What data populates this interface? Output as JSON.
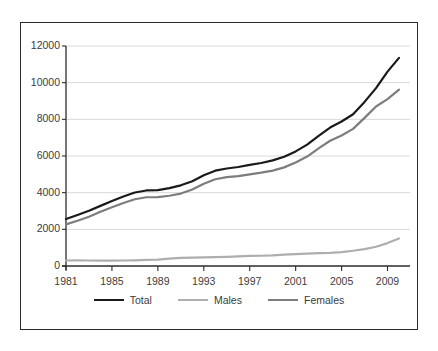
{
  "chart_data": {
    "type": "line",
    "title": "",
    "subtitle": "",
    "xlabel": "",
    "ylabel": "",
    "xlim": [
      1981,
      2010
    ],
    "ylim": [
      0,
      12000
    ],
    "grid": "horizontal",
    "legend_position": "bottom",
    "x": [
      1981,
      1982,
      1983,
      1984,
      1985,
      1986,
      1987,
      1988,
      1989,
      1990,
      1991,
      1992,
      1993,
      1994,
      1995,
      1996,
      1997,
      1998,
      1999,
      2000,
      2001,
      2002,
      2003,
      2004,
      2005,
      2006,
      2007,
      2008,
      2009,
      2010
    ],
    "xticks": [
      1981,
      1985,
      1989,
      1993,
      1997,
      2001,
      2005,
      2009
    ],
    "xtick_labels": [
      "1981",
      "1985",
      "1989",
      "1993",
      "1997",
      "2001",
      "2005",
      "2009"
    ],
    "yticks": [
      0,
      2000,
      4000,
      6000,
      8000,
      10000,
      12000
    ],
    "ytick_labels": [
      "0",
      "2000",
      "4000",
      "6000",
      "8000",
      "10000",
      "12000"
    ],
    "series": [
      {
        "name": "Total",
        "color": "#1a1a1a",
        "width": 2.2,
        "values": [
          2560,
          2780,
          3010,
          3280,
          3540,
          3790,
          4010,
          4120,
          4140,
          4250,
          4400,
          4620,
          4950,
          5200,
          5320,
          5400,
          5520,
          5620,
          5760,
          5960,
          6250,
          6620,
          7100,
          7550,
          7880,
          8280,
          8950,
          9700,
          10600,
          11350
        ]
      },
      {
        "name": "Males",
        "color": "#aeaeae",
        "width": 2.2,
        "values": [
          300,
          305,
          300,
          295,
          295,
          300,
          310,
          330,
          350,
          400,
          440,
          460,
          470,
          480,
          500,
          530,
          550,
          560,
          580,
          620,
          650,
          680,
          700,
          720,
          760,
          830,
          920,
          1050,
          1250,
          1500
        ]
      },
      {
        "name": "Females",
        "color": "#7d7d7d",
        "width": 2.2,
        "values": [
          2270,
          2470,
          2690,
          2960,
          3200,
          3440,
          3640,
          3750,
          3760,
          3830,
          3950,
          4170,
          4490,
          4730,
          4850,
          4900,
          5000,
          5090,
          5200,
          5380,
          5650,
          5970,
          6420,
          6830,
          7120,
          7480,
          8080,
          8700,
          9100,
          9620
        ]
      }
    ]
  },
  "axis": {
    "y_label_color": "#3b3b3b",
    "x_label_color": "#3b3b3b",
    "gridline_color": "#d9d9d9",
    "axis_color": "#2b2b2b"
  },
  "frame": {
    "border_color": "#2b2b2b"
  }
}
